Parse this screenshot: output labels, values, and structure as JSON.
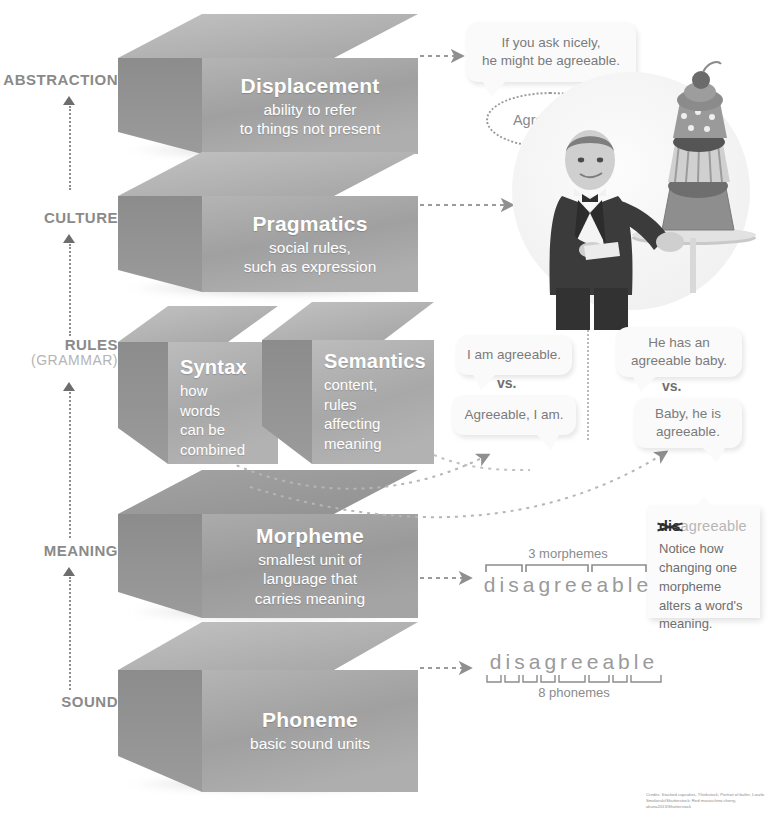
{
  "axis": {
    "title": "Levels of Language",
    "labels": [
      {
        "id": "abstraction",
        "text": "ABSTRACTION",
        "sub": ""
      },
      {
        "id": "culture",
        "text": "CULTURE",
        "sub": ""
      },
      {
        "id": "rules",
        "text": "RULES",
        "sub": "(GRAMMAR)"
      },
      {
        "id": "meaning",
        "text": "MEANING",
        "sub": ""
      },
      {
        "id": "sound",
        "text": "SOUND",
        "sub": ""
      }
    ]
  },
  "blocks": [
    {
      "id": "displacement",
      "title": "Displacement",
      "desc": "ability to refer\nto things not present"
    },
    {
      "id": "pragmatics",
      "title": "Pragmatics",
      "desc": "social rules,\nsuch as expression"
    },
    {
      "id": "syntax",
      "title": "Syntax",
      "desc": "how\nwords\ncan be\ncombined"
    },
    {
      "id": "semantics",
      "title": "Semantics",
      "desc": "content,\nrules\naffecting\nmeaning"
    },
    {
      "id": "morpheme",
      "title": "Morpheme",
      "desc": "smallest unit of\nlanguage that\ncarries meaning"
    },
    {
      "id": "phoneme",
      "title": "Phoneme",
      "desc": "basic sound units"
    }
  ],
  "bubbles": {
    "displacement": "If you ask nicely,\nhe might be agreeable.",
    "thought": "Agreeable?",
    "syntax_a": "I am agreeable.",
    "syntax_b": "Agreeable, I am.",
    "syntax_vs": "vs.",
    "semantics_a": "He has an\nagreeable baby.",
    "semantics_b": "Baby, he is\nagreeable.",
    "semantics_vs": "vs."
  },
  "morpheme_example": {
    "caption": "3 morphemes",
    "word": "disagreeable",
    "segments": [
      "dis",
      "agree",
      "able"
    ]
  },
  "phoneme_example": {
    "caption": "8 phonemes",
    "word": "disagreeable",
    "count": 8
  },
  "note": {
    "strike": "dis",
    "rest": "agreeable",
    "body": "Notice how\nchanging one\nmorpheme\nalters a word's\nmeaning."
  },
  "credits": "Credits: Stacked cupcakes, Thinkstock; Portrait of butler, Laszlo Smolovski/Shutterstock; Red maraschino cherry, akuna2013/Shutterstock",
  "colors": {
    "block_face": "#a6a6a6",
    "block_top": "#b2b2b2",
    "block_side": "#909090",
    "axis_text": "#8a8a8a",
    "bubble_bg": "#fafafa",
    "bubble_text": "#7b7b7b"
  }
}
